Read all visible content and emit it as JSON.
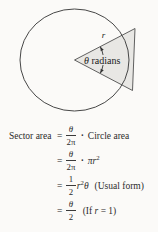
{
  "diagram": {
    "radius_label": "r",
    "angle_label_theta": "θ",
    "angle_label_rest": " radians",
    "colors": {
      "sector_fill": "#e8e7e4",
      "line": "#474747",
      "text": "#222222"
    }
  },
  "formulas": {
    "line1": {
      "lhs": "Sector area",
      "eq": "=",
      "frac_num": "θ",
      "frac_den": "2π",
      "dot": "·",
      "rhs": "Circle area"
    },
    "line2": {
      "eq": "=",
      "frac_num": "θ",
      "frac_den": "2π",
      "dot": "·",
      "rhs_base": "πr",
      "rhs_sup": "2"
    },
    "line3": {
      "eq": "=",
      "frac_num": "1",
      "frac_den": "2",
      "term_base": "r",
      "term_sup": "2",
      "term_var": "θ",
      "note": "(Usual form)"
    },
    "line4": {
      "eq": "=",
      "frac_num": "θ",
      "frac_den": "2",
      "note_pre": "(If ",
      "note_var": "r",
      "note_post": " = 1)"
    }
  }
}
